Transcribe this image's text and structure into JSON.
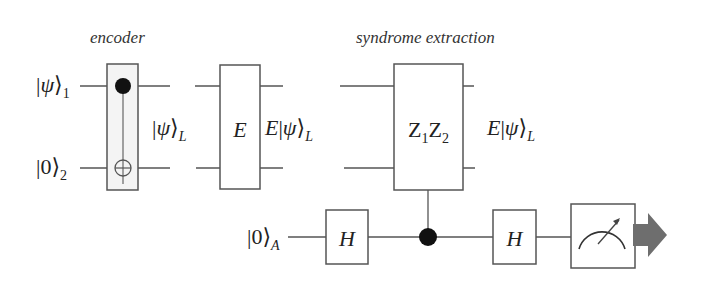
{
  "sections": {
    "encoder_title": "encoder",
    "syndrome_title": "syndrome extraction"
  },
  "inputs": {
    "qubit1": {
      "ket": "ψ",
      "sub": "1"
    },
    "qubit2": {
      "ket": "0",
      "sub": "2"
    },
    "ancilla": {
      "ket": "0",
      "sub": "A"
    }
  },
  "intermediate": {
    "logical_state": {
      "ket": "ψ",
      "sub": "L"
    },
    "after_error": {
      "prefix": "E",
      "ket": "ψ",
      "sub": "L"
    },
    "after_syndrome": {
      "prefix": "E",
      "ket": "ψ",
      "sub": "L"
    }
  },
  "gates": {
    "error": "E",
    "stabilizer": {
      "op1": "Z",
      "sub1": "1",
      "op2": "Z",
      "sub2": "2"
    },
    "hadamard1": "H",
    "hadamard2": "H"
  },
  "colors": {
    "wire": "#555555",
    "gate_border": "#555555",
    "control_dot": "#111111",
    "output_arrow": "#6e6e6e"
  }
}
